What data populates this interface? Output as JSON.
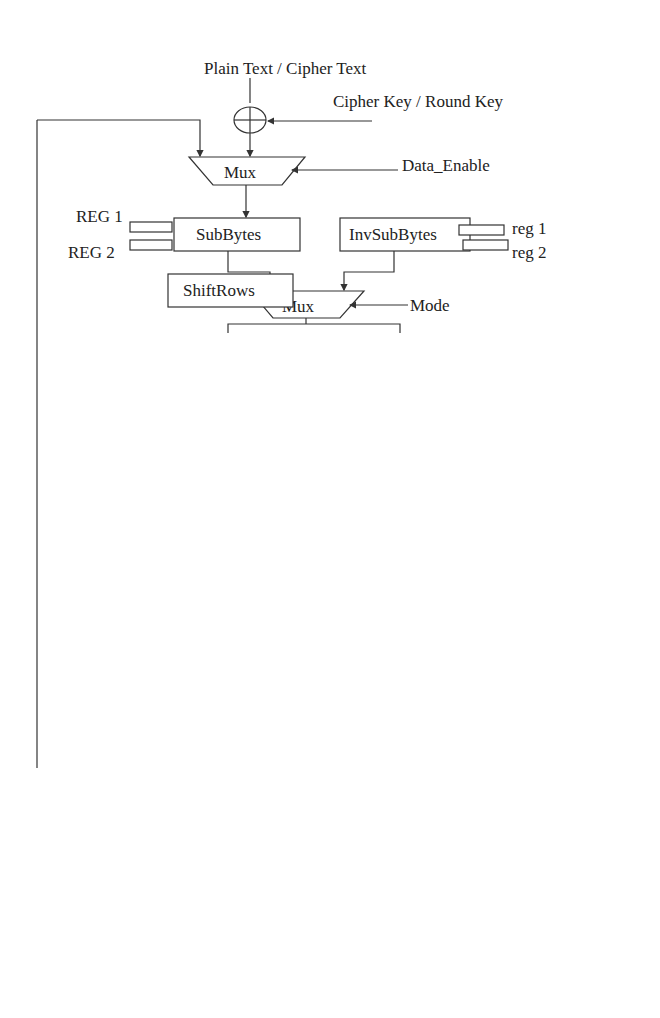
{
  "diagram": {
    "type": "AES encryption/decryption datapath block diagram",
    "inputs": {
      "plain_cipher_text": "Plain Text / Cipher Text",
      "cipher_round_key": "Cipher Key / Round Key",
      "data_enable": "Data_Enable"
    },
    "stage1": {
      "mux": "Mux",
      "subbytes": "SubBytes",
      "invsubbytes": "InvSubBytes",
      "reg1_left": "REG 1",
      "reg2_left": "REG 2",
      "reg1_right": "reg 1",
      "reg2_right": "reg 2"
    },
    "stage2": {
      "mux": "Mux",
      "mode": "Mode",
      "shiftrows": "ShiftRows",
      "invshiftrows": "InvShiftRows"
    },
    "stage3": {
      "mux": "Mux",
      "mode": "Mode",
      "mixcolumns": "MixColumns",
      "invmixcolumns": "InvMixColumns"
    },
    "stage4": {
      "mux": "Mux",
      "mode": "Mode",
      "reg3": "REG3",
      "addkey_enable": "Addkey_Enable",
      "clock": "Clock"
    },
    "roundkey_path": {
      "roundkey": "RoundKey",
      "invmixcolumns": "InvMixColumns",
      "mixroundkey": "MixRoundKey",
      "mux": "Mux",
      "mode": "Mode"
    },
    "output": {
      "reg4": "REG4",
      "clock": "Clock",
      "last_round": "Last_Round",
      "cipher_plain_text": "Cipher Text / Plain Text"
    }
  }
}
